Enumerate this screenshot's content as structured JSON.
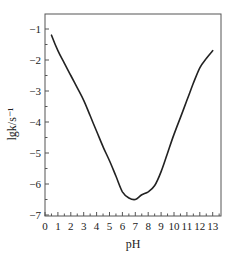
{
  "chart_data": {
    "type": "line",
    "title": "",
    "xlabel": "pH",
    "ylabel": "lgk/s⁻¹",
    "xlim": [
      0,
      13.6
    ],
    "ylim": [
      -7,
      -0.4
    ],
    "xticks": [
      0,
      1,
      2,
      3,
      4,
      5,
      6,
      7,
      8,
      9,
      10,
      11,
      12,
      13
    ],
    "yticks": [
      -1,
      -2,
      -3,
      -4,
      -5,
      -6,
      -7
    ],
    "grid": false,
    "legend": null,
    "series": [
      {
        "name": "lgk vs pH",
        "x": [
          0.5,
          1.0,
          1.5,
          2.0,
          2.5,
          3.0,
          3.5,
          4.0,
          4.5,
          5.0,
          5.5,
          6.0,
          6.5,
          7.0,
          7.5,
          8.0,
          8.5,
          9.0,
          9.5,
          10.0,
          10.5,
          11.0,
          11.5,
          12.0,
          12.5,
          13.0
        ],
        "y": [
          -1.2,
          -1.7,
          -2.1,
          -2.5,
          -2.9,
          -3.3,
          -3.8,
          -4.3,
          -4.8,
          -5.25,
          -5.75,
          -6.25,
          -6.45,
          -6.5,
          -6.35,
          -6.25,
          -6.05,
          -5.6,
          -5.0,
          -4.4,
          -3.85,
          -3.3,
          -2.75,
          -2.25,
          -1.95,
          -1.7
        ]
      }
    ]
  }
}
